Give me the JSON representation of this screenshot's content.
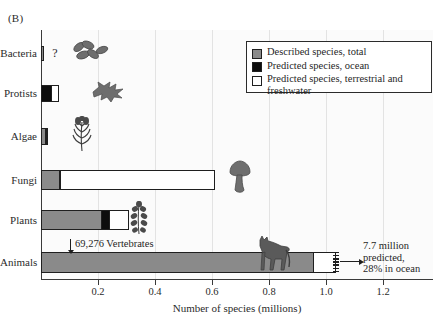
{
  "panel": {
    "letter": "(B)"
  },
  "legend": {
    "items": [
      {
        "label": "Described species, total",
        "swatch": "gray",
        "color": "#8a8a8a"
      },
      {
        "label": "Predicted species, ocean",
        "swatch": "black",
        "color": "#0d0d0d"
      },
      {
        "label": "Predicted species, terrestrial and freshwater",
        "swatch": "white",
        "color": "#ffffff"
      }
    ]
  },
  "annotations": {
    "vertebrates": "69,276 Vertebrates",
    "animals_predicted_line1": "7.7 million",
    "animals_predicted_line2": "predicted,",
    "animals_predicted_line3": "28% in ocean",
    "bacteria_unknown": "?"
  },
  "icons": {
    "bacteria": "bacteria-icon",
    "protists": "amoeba-icon",
    "algae": "seaweed-icon",
    "fungi": "mushroom-icon",
    "plants": "plant-icon",
    "animals": "horse-icon"
  },
  "chart_data": {
    "type": "bar",
    "orientation": "horizontal",
    "title": "",
    "xlabel": "Number of species (millions)",
    "ylabel": "",
    "xlim": [
      0,
      1.375
    ],
    "xticks": [
      0.2,
      0.4,
      0.6,
      0.8,
      1.0,
      1.2
    ],
    "xticklabels": [
      "0.2",
      "0.4",
      "0.6",
      "0.8",
      "1.0",
      "1.2"
    ],
    "grid": "vertical-only",
    "legend_position": "top-right",
    "categories": [
      "Bacteria",
      "Protists",
      "Algae",
      "Fungi",
      "Plants",
      "Animals"
    ],
    "series": [
      {
        "name": "Described species, total",
        "color": "#8a8a8a",
        "values": [
          0.011,
          0.0,
          0.017,
          0.065,
          0.215,
          0.958
        ]
      },
      {
        "name": "Predicted species, ocean",
        "color": "#0d0d0d",
        "values": [
          0.0,
          0.037,
          0.007,
          0.008,
          0.03,
          0.0
        ]
      },
      {
        "name": "Predicted species, terrestrial and freshwater",
        "color": "#ffffff",
        "values": [
          0.0,
          0.031,
          0.009,
          0.545,
          0.07,
          0.08
        ]
      }
    ],
    "notes": [
      "Bacteria total unknown, marked with a question mark",
      "Animals bar has a torn right edge indicating 7.7 million predicted, 28% in ocean",
      "Arrow marks 69,276 Vertebrates within the Animals described bar"
    ]
  }
}
